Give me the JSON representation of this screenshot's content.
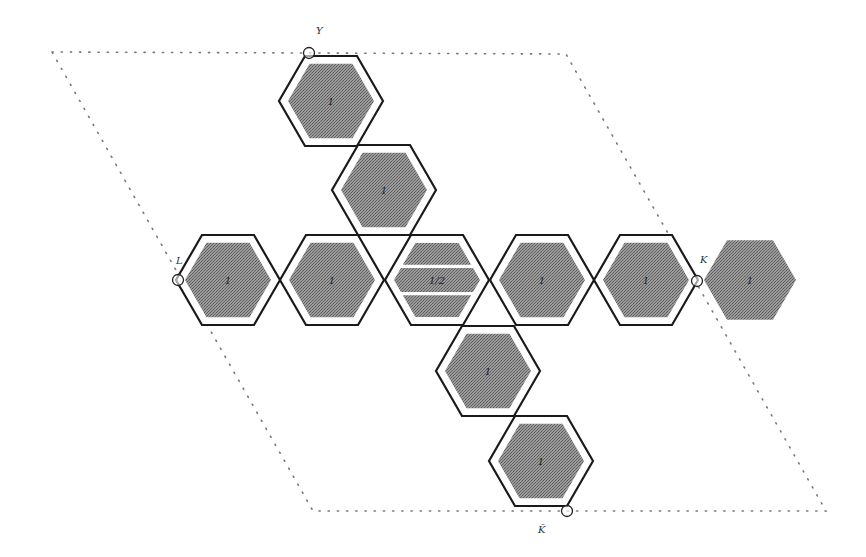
{
  "diagram": {
    "type": "hexagonal-tiling-brillouin-zone",
    "colors": {
      "fill": "#8a8a8a",
      "outline": "#1a1a1a",
      "boundary_dots": "#777777",
      "background": "#ffffff"
    },
    "boundary": {
      "style": "dotted-parallelogram",
      "corners": [
        [
          52,
          52
        ],
        [
          566,
          54
        ],
        [
          826,
          511
        ],
        [
          313,
          511
        ]
      ]
    },
    "hex_radius": 52,
    "hexagons": [
      {
        "id": "hex-top-1",
        "cx": 331,
        "cy": 101,
        "label": "1",
        "outlined": true,
        "striped": false
      },
      {
        "id": "hex-top-2",
        "cx": 384,
        "cy": 190,
        "label": "1",
        "outlined": true,
        "striped": false
      },
      {
        "id": "hex-row-1",
        "cx": 228,
        "cy": 280,
        "label": "1",
        "outlined": true,
        "striped": false
      },
      {
        "id": "hex-row-2",
        "cx": 332,
        "cy": 280,
        "label": "1",
        "outlined": true,
        "striped": false
      },
      {
        "id": "hex-center",
        "cx": 437,
        "cy": 280,
        "label": "1/2",
        "outlined": true,
        "striped": true
      },
      {
        "id": "hex-row-4",
        "cx": 542,
        "cy": 280,
        "label": "1",
        "outlined": true,
        "striped": false
      },
      {
        "id": "hex-row-5",
        "cx": 646,
        "cy": 280,
        "label": "1",
        "outlined": true,
        "striped": false
      },
      {
        "id": "hex-outside",
        "cx": 750,
        "cy": 280,
        "label": "1",
        "outlined": false,
        "striped": false
      },
      {
        "id": "hex-bottom-1",
        "cx": 488,
        "cy": 371,
        "label": "1",
        "outlined": true,
        "striped": false
      },
      {
        "id": "hex-bottom-2",
        "cx": 541,
        "cy": 461,
        "label": "1",
        "outlined": true,
        "striped": false
      }
    ],
    "points": [
      {
        "id": "point-Y",
        "label": "Y",
        "x": 309,
        "y": 53,
        "lx": 316,
        "ly": 34
      },
      {
        "id": "point-L",
        "label": "L",
        "x": 178,
        "y": 280,
        "lx": 176,
        "ly": 264
      },
      {
        "id": "point-K",
        "label": "K",
        "x": 697,
        "y": 281,
        "lx": 700,
        "ly": 263
      },
      {
        "id": "point-K-bar",
        "label": "K̄",
        "x": 567,
        "y": 511,
        "lx": 538,
        "ly": 533
      }
    ]
  }
}
